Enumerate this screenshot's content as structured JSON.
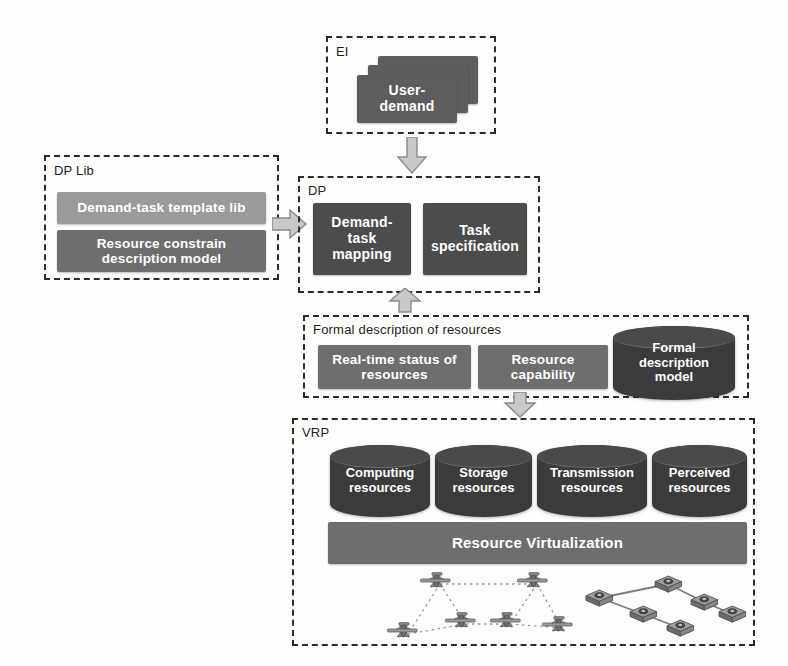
{
  "diagram": {
    "colors": {
      "dark_box": "#5d5d5d",
      "darker_box": "#4c4c4c",
      "mid_box": "#6e6e6e",
      "light_box": "#9a9a9a",
      "cylinder": "#3b3b3b",
      "border": "#2b2b2b",
      "arrow_fill": "#c9c9c9",
      "arrow_stroke": "#7a7a7a",
      "background": "#fdfdfc"
    }
  },
  "groups": {
    "ei": {
      "label": "EI"
    },
    "dp_lib": {
      "label": "DP Lib"
    },
    "dp": {
      "label": "DP"
    },
    "formal": {
      "label": "Formal description of resources"
    },
    "vrp": {
      "label": "VRP"
    }
  },
  "ei": {
    "card_label": "User-\ndemand",
    "card_line1": "User-",
    "card_line2": "demand",
    "card_count": 3
  },
  "dp_lib": {
    "items": [
      {
        "label": "Demand-task template lib",
        "shade": "light"
      },
      {
        "label": "Resource constrain\ndescription model",
        "shade": "mid"
      }
    ],
    "item0": "Demand-task template lib",
    "item1_line1": "Resource constrain",
    "item1_line2": "description model"
  },
  "dp": {
    "items": [
      {
        "label": "Demand-\ntask\nmapping"
      },
      {
        "label": "Task\nspecification"
      }
    ],
    "item0_line1": "Demand-",
    "item0_line2": "task",
    "item0_line3": "mapping",
    "item1_line1": "Task",
    "item1_line2": "specification"
  },
  "formal": {
    "items": [
      {
        "label": "Real-time status of\nresources",
        "shape": "box"
      },
      {
        "label": "Resource\ncapability",
        "shape": "box"
      },
      {
        "label": "Formal\ndescription\nmodel",
        "shape": "cylinder"
      }
    ],
    "item0_line1": "Real-time status of",
    "item0_line2": "resources",
    "item1_line1": "Resource",
    "item1_line2": "capability",
    "item2_line1": "Formal",
    "item2_line2": "description",
    "item2_line3": "model"
  },
  "vrp": {
    "cylinders": [
      {
        "label": "Computing\nresources"
      },
      {
        "label": "Storage\nresources"
      },
      {
        "label": "Transmission\nresources"
      },
      {
        "label": "Perceived\nresources"
      }
    ],
    "cyl0_line1": "Computing",
    "cyl0_line2": "resources",
    "cyl1_line1": "Storage",
    "cyl1_line2": "resources",
    "cyl2_line1": "Transmission",
    "cyl2_line2": "resources",
    "cyl3_line1": "Perceived",
    "cyl3_line2": "resources",
    "virtualization_bar": "Resource Virtualization",
    "scene": {
      "left_network": "aircraft-swarm",
      "right_network": "server-node-network",
      "aircraft_count": 6,
      "node_count": 6
    }
  },
  "arrows": [
    {
      "name": "ei-to-dp",
      "direction": "down"
    },
    {
      "name": "dplib-to-dp",
      "direction": "right"
    },
    {
      "name": "formal-to-dp",
      "direction": "up"
    },
    {
      "name": "formal-to-vrp",
      "direction": "down"
    }
  ]
}
